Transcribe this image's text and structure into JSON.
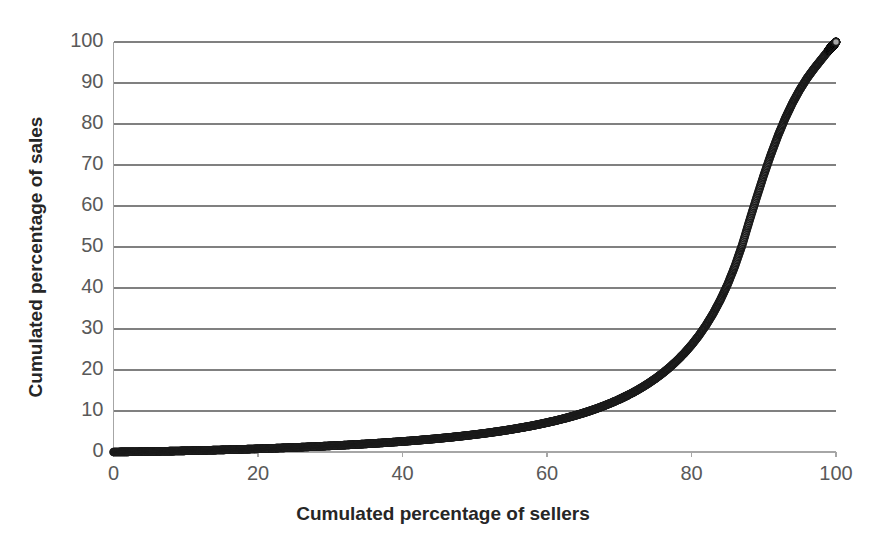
{
  "chart_data": {
    "type": "scatter",
    "title": "",
    "xlabel": "Cumulated percentage of sellers",
    "ylabel": "Cumulated percentage of sales",
    "xlim": [
      0,
      100
    ],
    "ylim": [
      0,
      100
    ],
    "xticks": [
      0,
      20,
      40,
      60,
      80,
      100
    ],
    "yticks": [
      0,
      10,
      20,
      30,
      40,
      50,
      60,
      70,
      80,
      90,
      100
    ],
    "grid": "horizontal",
    "legend": "none",
    "marker": {
      "shape": "circle",
      "fill_color": "#a6a6a6",
      "edge_color": "#1a1a1a",
      "size_px": 7
    },
    "series": [
      {
        "name": "Cumulated sales concentration",
        "x": [
          0,
          1,
          2,
          3,
          4,
          5,
          6,
          7,
          8,
          9,
          10,
          11,
          12,
          13,
          14,
          15,
          16,
          17,
          18,
          19,
          20,
          21,
          22,
          23,
          24,
          25,
          26,
          27,
          28,
          29,
          30,
          31,
          32,
          33,
          34,
          35,
          36,
          37,
          38,
          39,
          40,
          41,
          42,
          43,
          44,
          45,
          46,
          47,
          48,
          49,
          50,
          51,
          52,
          53,
          54,
          55,
          56,
          57,
          58,
          59,
          60,
          61,
          62,
          63,
          64,
          65,
          66,
          67,
          68,
          69,
          70,
          71,
          72,
          73,
          74,
          75,
          76,
          77,
          78,
          79,
          80,
          81,
          82,
          83,
          84,
          85,
          86,
          87,
          88,
          89,
          90,
          91,
          92,
          93,
          94,
          95,
          96,
          97,
          98,
          99,
          100
        ],
        "y": [
          0,
          0.02,
          0.04,
          0.06,
          0.09,
          0.12,
          0.15,
          0.18,
          0.21,
          0.25,
          0.29,
          0.33,
          0.37,
          0.41,
          0.46,
          0.51,
          0.56,
          0.61,
          0.66,
          0.72,
          0.78,
          0.84,
          0.9,
          0.97,
          1.04,
          1.11,
          1.18,
          1.26,
          1.34,
          1.42,
          1.5,
          1.59,
          1.68,
          1.78,
          1.88,
          1.98,
          2.09,
          2.2,
          2.32,
          2.44,
          2.57,
          2.7,
          2.84,
          2.99,
          3.14,
          3.3,
          3.47,
          3.65,
          3.84,
          4.04,
          4.25,
          4.47,
          4.7,
          4.95,
          5.21,
          5.49,
          5.79,
          6.1,
          6.43,
          6.79,
          7.17,
          7.57,
          8.0,
          8.46,
          8.96,
          9.49,
          10.06,
          10.68,
          11.34,
          12.06,
          12.84,
          13.68,
          14.6,
          15.6,
          16.7,
          17.9,
          19.22,
          20.68,
          22.3,
          24.1,
          26.1,
          28.35,
          30.9,
          33.8,
          37.1,
          40.9,
          45.3,
          50.4,
          56.3,
          62.0,
          67.5,
          72.6,
          77.3,
          81.5,
          85.2,
          88.4,
          91.2,
          93.6,
          95.8,
          98.0,
          100
        ]
      }
    ]
  },
  "axes": {
    "y_tick_labels": [
      "100",
      "90",
      "80",
      "70",
      "60",
      "50",
      "40",
      "30",
      "20",
      "10",
      "0"
    ],
    "x_tick_labels": [
      "0",
      "20",
      "40",
      "60",
      "80",
      "100"
    ],
    "x_title": "Cumulated percentage of sellers",
    "y_title": "Cumulated percentage of sales"
  },
  "style": {
    "background": "#ffffff",
    "gridline_color": "#808080",
    "axis_line_color": "#a6a6a6",
    "tick_label_color": "#595959",
    "title_color": "#262626"
  }
}
